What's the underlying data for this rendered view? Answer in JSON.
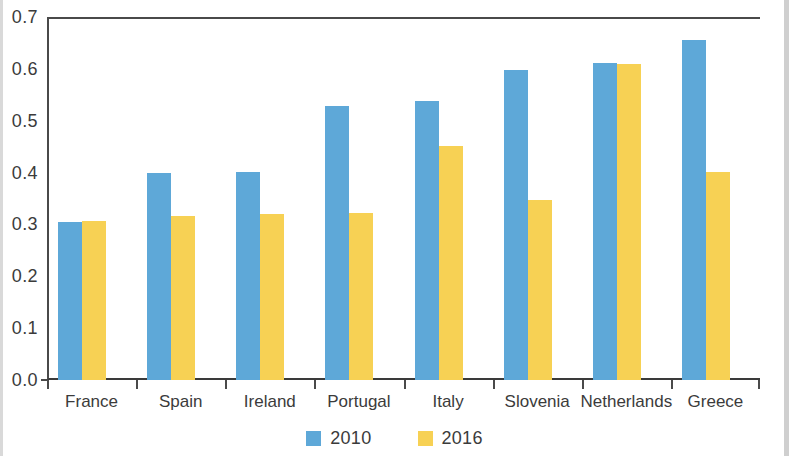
{
  "chart_data": {
    "type": "bar",
    "title": "",
    "subtitle": "",
    "xlabel": "",
    "ylabel": "",
    "categories": [
      "France",
      "Spain",
      "Ireland",
      "Portugal",
      "Italy",
      "Slovenia",
      "Netherlands",
      "Greece"
    ],
    "series": [
      {
        "name": "2010",
        "color": "#5ea8d8",
        "values": [
          0.305,
          0.4,
          0.402,
          0.528,
          0.538,
          0.598,
          0.612,
          0.655
        ]
      },
      {
        "name": "2016",
        "color": "#f7d154",
        "values": [
          0.307,
          0.317,
          0.32,
          0.322,
          0.452,
          0.348,
          0.61,
          0.402
        ]
      }
    ],
    "ylim": [
      0.0,
      0.7
    ],
    "ytick_step": 0.1,
    "ytick_labels": [
      "0.7",
      "0.6",
      "0.5",
      "0.4",
      "0.3",
      "0.2",
      "0.1",
      "0.0"
    ],
    "ytick_values": [
      0.7,
      0.6,
      0.5,
      0.4,
      0.3,
      0.2,
      0.1,
      0.0
    ],
    "grid": false,
    "legend_position": "bottom-center",
    "legend_entries": [
      {
        "label": "2010",
        "color": "#5ea8d8"
      },
      {
        "label": "2016",
        "color": "#f7d154"
      }
    ]
  },
  "colors": {
    "series_2010": "#5ea8d8",
    "series_2016": "#f7d154",
    "axis": "#4a4a4a",
    "text": "#3b3b3b",
    "background": "#ffffff"
  }
}
